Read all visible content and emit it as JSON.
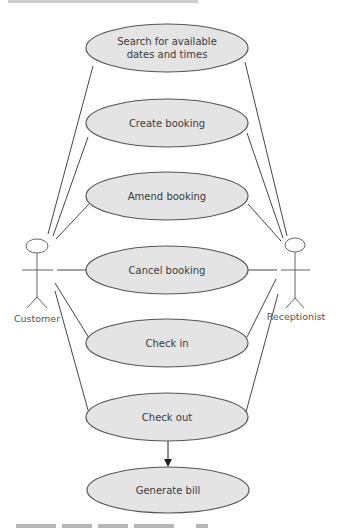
{
  "diagram": {
    "type": "uml-use-case",
    "actors": [
      {
        "id": "customer",
        "label": "Customer"
      },
      {
        "id": "receptionist",
        "label": "Receptionist"
      }
    ],
    "use_cases": [
      {
        "id": "search",
        "label_line1": "Search for available",
        "label_line2": "dates and times"
      },
      {
        "id": "create",
        "label": "Create booking"
      },
      {
        "id": "amend",
        "label": "Amend booking"
      },
      {
        "id": "cancel",
        "label": "Cancel booking"
      },
      {
        "id": "checkin",
        "label": "Check in"
      },
      {
        "id": "checkout",
        "label": "Check out"
      },
      {
        "id": "bill",
        "label": "Generate bill"
      }
    ],
    "associations": [
      [
        "customer",
        "search"
      ],
      [
        "customer",
        "create"
      ],
      [
        "customer",
        "amend"
      ],
      [
        "customer",
        "cancel"
      ],
      [
        "customer",
        "checkin"
      ],
      [
        "customer",
        "checkout"
      ],
      [
        "receptionist",
        "search"
      ],
      [
        "receptionist",
        "create"
      ],
      [
        "receptionist",
        "amend"
      ],
      [
        "receptionist",
        "cancel"
      ],
      [
        "receptionist",
        "checkin"
      ],
      [
        "receptionist",
        "checkout"
      ]
    ],
    "dependencies": [
      {
        "from": "checkout",
        "to": "bill",
        "style": "directed-arrow"
      }
    ],
    "colors": {
      "ellipse_fill": "#e4e4e4",
      "ellipse_stroke": "#555555",
      "line": "#444444",
      "text": "#3a3a3a"
    }
  }
}
